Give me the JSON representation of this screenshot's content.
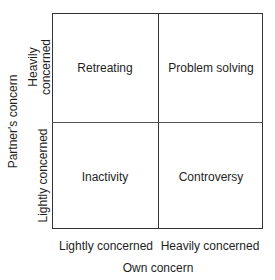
{
  "diagram": {
    "type": "2x2 matrix",
    "x_axis": {
      "title": "Own concern",
      "ticks": [
        "Lightly concerned",
        "Heavily concerned"
      ]
    },
    "y_axis": {
      "title": "Partner's concern",
      "ticks_top_to_bottom": [
        {
          "line1": "Heavily",
          "line2": "concerned"
        },
        {
          "line1": "Lightly concerned"
        }
      ]
    },
    "quadrants": {
      "top_left": "Retreating",
      "top_right": "Problem solving",
      "bottom_left": "Inactivity",
      "bottom_right": "Controversy"
    },
    "colors": {
      "line": "#333333",
      "text": "#1e1e1e",
      "background": "#ffffff"
    }
  }
}
